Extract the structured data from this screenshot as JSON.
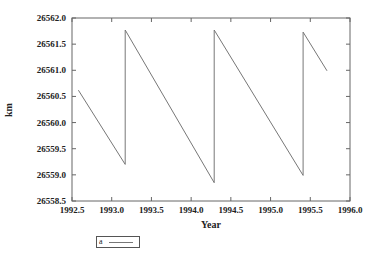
{
  "chart_data": {
    "type": "line",
    "title": "",
    "xlabel": "Year",
    "ylabel": "km",
    "xlim": [
      1992.5,
      1996.0
    ],
    "ylim": [
      26558.5,
      26562.0
    ],
    "xticks": [
      "1992.5",
      "1993.0",
      "1993.5",
      "1994.0",
      "1994.5",
      "1995.0",
      "1995.5",
      "1996.0"
    ],
    "yticks": [
      "26558.5",
      "26559.0",
      "26559.5",
      "26560.0",
      "26560.5",
      "26561.0",
      "26561.5",
      "26562.0"
    ],
    "grid": false,
    "legend_position": "below-left",
    "series": [
      {
        "name": "a",
        "color": "#777777",
        "x": [
          1992.58,
          1993.17,
          1993.17,
          1994.29,
          1994.29,
          1995.41,
          1995.41,
          1995.71
        ],
        "y": [
          26560.62,
          26559.2,
          26561.77,
          26558.85,
          26561.77,
          26558.99,
          26561.73,
          26560.99
        ]
      }
    ]
  },
  "legend": {
    "label": "a"
  },
  "axes": {
    "x_title": "Year",
    "y_title": "km"
  }
}
